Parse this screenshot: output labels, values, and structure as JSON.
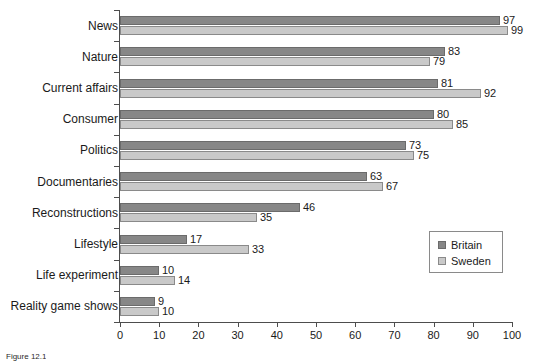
{
  "chart_data": {
    "type": "bar",
    "orientation": "horizontal",
    "title": "",
    "xlabel": "",
    "ylabel": "",
    "xlim": [
      0,
      100
    ],
    "xticks": [
      0,
      10,
      20,
      30,
      40,
      50,
      60,
      70,
      80,
      90,
      100
    ],
    "grid": false,
    "legend_position": "middle-right",
    "categories": [
      "News",
      "Nature",
      "Current affairs",
      "Consumer",
      "Politics",
      "Documentaries",
      "Reconstructions",
      "Lifestyle",
      "Life experiment",
      "Reality game shows"
    ],
    "series": [
      {
        "name": "Britain",
        "color": "#878787",
        "values": [
          97,
          83,
          81,
          80,
          73,
          63,
          46,
          17,
          10,
          9
        ]
      },
      {
        "name": "Sweden",
        "color": "#c9c9c9",
        "values": [
          99,
          79,
          92,
          85,
          75,
          67,
          35,
          33,
          14,
          10
        ]
      }
    ]
  },
  "legend": {
    "items": [
      {
        "label": "Britain",
        "swatch": "britain"
      },
      {
        "label": "Sweden",
        "swatch": "sweden"
      }
    ]
  },
  "caption": {
    "text": "Figure 12.1"
  },
  "colors": {
    "britain": "#878787",
    "sweden": "#c9c9c9",
    "axis": "#4d4d4d",
    "background": "#ffffff"
  }
}
